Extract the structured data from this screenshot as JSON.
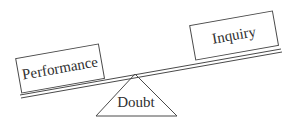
{
  "diagram": {
    "type": "seesaw-balance",
    "colors": {
      "stroke": "#4a4a4a",
      "text": "#2f2f2f",
      "background": "#ffffff"
    },
    "fulcrum": {
      "label": "Doubt",
      "shape": "triangle"
    },
    "left_box": {
      "label": "Performance",
      "side": "left",
      "position": "lower"
    },
    "right_box": {
      "label": "Inquiry",
      "side": "right",
      "position": "higher"
    },
    "beam": {
      "style": "double-line",
      "tilt": "rising to the right"
    }
  }
}
